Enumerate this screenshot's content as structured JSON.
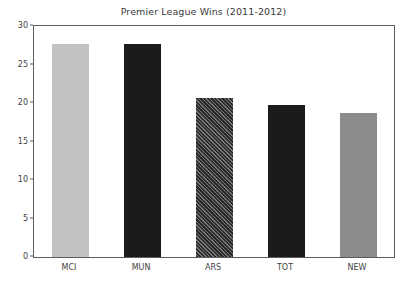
{
  "chart_data": {
    "type": "bar",
    "title": "Premier League Wins (2011-2012)",
    "xlabel": "",
    "ylabel": "",
    "categories": [
      "MCI",
      "MUN",
      "ARS",
      "TOT",
      "NEW"
    ],
    "values": [
      27.6,
      27.6,
      20.6,
      19.7,
      18.7
    ],
    "ylim": [
      0,
      30
    ],
    "yticks": [
      0,
      5,
      10,
      15,
      20,
      25,
      30
    ],
    "ytick_labels": [
      "0",
      "5",
      "10",
      "15",
      "20",
      "25",
      "30"
    ],
    "grid": false,
    "legend": null,
    "bar_styles": [
      {
        "category": "MCI",
        "fill": "#c2c2c2",
        "pattern": "solid"
      },
      {
        "category": "MUN",
        "fill": "#1b1b1b",
        "pattern": "solid"
      },
      {
        "category": "ARS",
        "fill": "#2b2b2b",
        "pattern": "diagonal-hatch"
      },
      {
        "category": "TOT",
        "fill": "#1b1b1b",
        "pattern": "solid"
      },
      {
        "category": "NEW",
        "fill": "#8b8b8b",
        "pattern": "solid"
      }
    ],
    "axis_color": "#5c5c5c",
    "background": "#ffffff"
  }
}
